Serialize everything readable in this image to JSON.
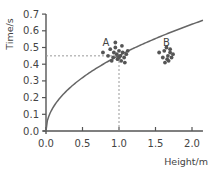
{
  "chart_data": {
    "type": "scatter",
    "title": "",
    "xlabel": "Height/m",
    "ylabel": "Time/s",
    "xlim": [
      0,
      2.15
    ],
    "ylim": [
      0,
      0.7
    ],
    "x_ticks": [
      "0.0",
      "0.5",
      "1.0",
      "1.5",
      "2.0"
    ],
    "y_ticks": [
      "0.0",
      "0.1",
      "0.2",
      "0.3",
      "0.4",
      "0.5",
      "0.6",
      "0.7"
    ],
    "grid": false,
    "legend": null,
    "curve": {
      "name": "theoretical t = sqrt(2h/g)",
      "type": "line",
      "x": [
        0,
        0.05,
        0.1,
        0.2,
        0.3,
        0.5,
        0.75,
        1.0,
        1.25,
        1.5,
        1.75,
        2.0,
        2.15
      ],
      "y": [
        0,
        0.1,
        0.143,
        0.202,
        0.247,
        0.319,
        0.391,
        0.452,
        0.505,
        0.553,
        0.597,
        0.639,
        0.662
      ]
    },
    "reference_lines": [
      {
        "orientation": "horizontal",
        "y": 0.45,
        "from_x": 0,
        "to_x": 1.0,
        "style": "dashed"
      },
      {
        "orientation": "vertical",
        "x": 1.0,
        "from_y": 0,
        "to_y": 0.45,
        "style": "dashed"
      }
    ],
    "series": [
      {
        "name": "A",
        "x": [
          0.78,
          0.85,
          0.88,
          0.92,
          0.95,
          0.97,
          0.98,
          1.0,
          1.02,
          1.03,
          1.05,
          1.07,
          1.08,
          1.1,
          1.12,
          0.9,
          0.95,
          1.0,
          1.04,
          0.93
        ],
        "y": [
          0.47,
          0.45,
          0.49,
          0.44,
          0.5,
          0.46,
          0.43,
          0.48,
          0.45,
          0.42,
          0.47,
          0.44,
          0.41,
          0.46,
          0.48,
          0.42,
          0.53,
          0.44,
          0.51,
          0.47
        ]
      },
      {
        "name": "B",
        "x": [
          1.55,
          1.6,
          1.62,
          1.65,
          1.67,
          1.68,
          1.7,
          1.72,
          1.63,
          1.66,
          1.7,
          1.74
        ],
        "y": [
          0.47,
          0.44,
          0.48,
          0.5,
          0.45,
          0.42,
          0.47,
          0.44,
          0.41,
          0.43,
          0.49,
          0.46
        ]
      }
    ],
    "annotations": [
      {
        "text": "A",
        "x": 0.82,
        "y": 0.51
      },
      {
        "text": "B",
        "x": 1.65,
        "y": 0.51
      }
    ]
  },
  "colors": {
    "axis": "#555555",
    "curve": "#666666",
    "points": "#555555",
    "dashed": "#999999",
    "text": "#444444"
  }
}
